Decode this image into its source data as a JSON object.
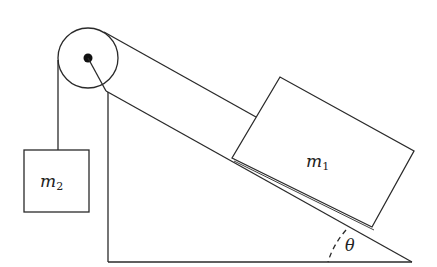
{
  "diagram": {
    "type": "physics-free-body-setup",
    "labels": {
      "block_on_incline": {
        "symbol": "m",
        "subscript": "1"
      },
      "hanging_block": {
        "symbol": "m",
        "subscript": "2"
      },
      "angle": "θ"
    },
    "colors": {
      "stroke": "#2a2a2a",
      "background": "#ffffff"
    }
  }
}
